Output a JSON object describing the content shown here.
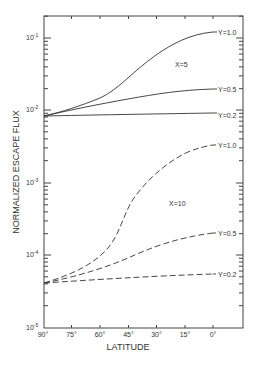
{
  "chart_data": {
    "type": "line",
    "title": "",
    "xlabel": "LATITUDE",
    "ylabel": "NORMALIZED ESCAPE FLUX",
    "yscale": "log",
    "ylim": [
      1e-05,
      0.2
    ],
    "xlim": [
      90,
      -10
    ],
    "x_ticks": [
      90,
      75,
      60,
      45,
      30,
      15,
      0
    ],
    "x_tick_labels": [
      "90°",
      "75°",
      "60°",
      "45°",
      "30°",
      "15°",
      "0°"
    ],
    "y_ticks": [
      0.1,
      0.01,
      0.001,
      0.0001,
      1e-05
    ],
    "y_tick_labels": [
      {
        "base": "10",
        "exp": "-1"
      },
      {
        "base": "10",
        "exp": "-2"
      },
      {
        "base": "10",
        "exp": "-3"
      },
      {
        "base": "10",
        "exp": "-4"
      },
      {
        "base": "10",
        "exp": "-5"
      }
    ],
    "grid": false,
    "x": [
      90,
      75,
      60,
      45,
      30,
      15,
      0
    ],
    "series": [
      {
        "name": "X=5, Y=1.0",
        "group": "X=5",
        "label": "Y=1.0",
        "style": "solid",
        "values": [
          0.0083,
          0.012,
          0.019,
          0.036,
          0.085,
          0.11,
          0.12
        ]
      },
      {
        "name": "X=5, Y=0.5",
        "group": "X=5",
        "label": "Y=0.5",
        "style": "solid",
        "values": [
          0.0083,
          0.01,
          0.0133,
          0.0167,
          0.0195,
          0.02,
          0.02
        ]
      },
      {
        "name": "X=5, Y=0.2",
        "group": "X=5",
        "label": "Y=0.2",
        "style": "solid",
        "values": [
          0.0083,
          0.0085,
          0.0087,
          0.0088,
          0.0089,
          0.009,
          0.0091
        ]
      },
      {
        "name": "X=10, Y=1.0",
        "group": "X=10",
        "label": "Y=1.0",
        "style": "dashed",
        "values": [
          4.2e-05,
          7e-05,
          0.000155,
          0.00091,
          0.0036,
          0.0027,
          0.0033
        ]
      },
      {
        "name": "X=10, Y=0.5",
        "group": "X=10",
        "label": "Y=0.5",
        "style": "dashed",
        "values": [
          4.2e-05,
          5.5e-05,
          7.8e-05,
          0.00011,
          0.00016,
          0.00019,
          0.0002
        ]
      },
      {
        "name": "X=10, Y=0.2",
        "group": "X=10",
        "label": "Y=0.2",
        "style": "dashed",
        "values": [
          4.2e-05,
          4.5e-05,
          4.8e-05,
          5e-05,
          5.2e-05,
          5.4e-05,
          5.5e-05
        ]
      }
    ],
    "annotations": [
      {
        "text": "X=5",
        "x": 38,
        "y": 0.045
      },
      {
        "text": "X=10",
        "x": 40,
        "y": 0.00055
      }
    ]
  },
  "labels": {
    "xlabel": "LATITUDE",
    "ylabel": "NORMALIZED ESCAPE FLUX",
    "x5": "X=5",
    "x10": "X=10",
    "s1": "Y=1.0",
    "s2": "Y=0.5",
    "s3": "Y=0.2",
    "s4": "Y=1.0",
    "s5": "Y=0.5",
    "s6": "Y=0.2",
    "xt0": "90°",
    "xt1": "75°",
    "xt2": "60°",
    "xt3": "45°",
    "xt4": "30°",
    "xt5": "15°",
    "xt6": "0°",
    "yb": "10",
    "ye1": "-1",
    "ye2": "-2",
    "ye3": "-3",
    "ye4": "-4",
    "ye5": "-5"
  }
}
